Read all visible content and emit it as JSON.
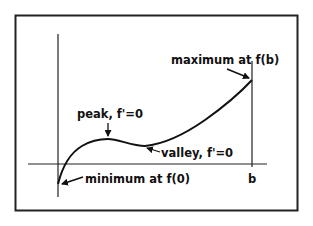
{
  "diagram": {
    "labels": {
      "maximum": "maximum at f(b)",
      "peak": "peak, f'=0",
      "valley": "valley, f'=0",
      "minimum": "minimum at f(0)",
      "b": "b"
    },
    "colors": {
      "ink": "#111111",
      "background": "#ffffff"
    },
    "nodes": [
      {
        "id": "minimum",
        "point": [
          58,
          184
        ],
        "label": "minimum at f(0)"
      },
      {
        "id": "peak",
        "point": [
          108,
          139
        ],
        "label": "peak, f'=0"
      },
      {
        "id": "valley",
        "point": [
          145,
          146
        ],
        "label": "valley, f'=0"
      },
      {
        "id": "maximum",
        "point": [
          252,
          80
        ],
        "label": "maximum at f(b)"
      }
    ]
  }
}
